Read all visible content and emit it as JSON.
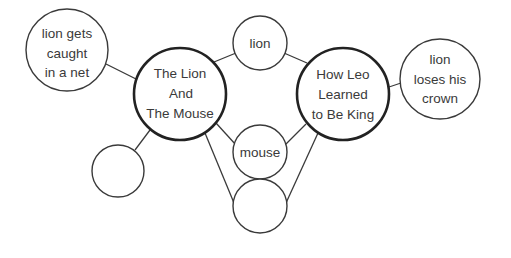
{
  "diagram": {
    "type": "double-bubble-map",
    "colors": {
      "stroke": "#3a3a3a",
      "text": "#3a3a3a",
      "background": "#ffffff"
    },
    "main_topics": [
      {
        "id": "left",
        "lines": [
          "The Lion",
          "And",
          "The Mouse"
        ]
      },
      {
        "id": "right",
        "lines": [
          "How Leo",
          "Learned",
          "to Be King"
        ]
      }
    ],
    "shared": [
      {
        "id": "shared-1",
        "lines": [
          "lion"
        ]
      },
      {
        "id": "shared-2",
        "lines": [
          "mouse"
        ]
      },
      {
        "id": "shared-3",
        "lines": []
      }
    ],
    "left_only": [
      {
        "id": "left-1",
        "lines": [
          "lion gets",
          "caught",
          "in a net"
        ]
      },
      {
        "id": "left-2",
        "lines": []
      }
    ],
    "right_only": [
      {
        "id": "right-1",
        "lines": [
          "lion",
          "loses his",
          "crown"
        ]
      }
    ]
  }
}
